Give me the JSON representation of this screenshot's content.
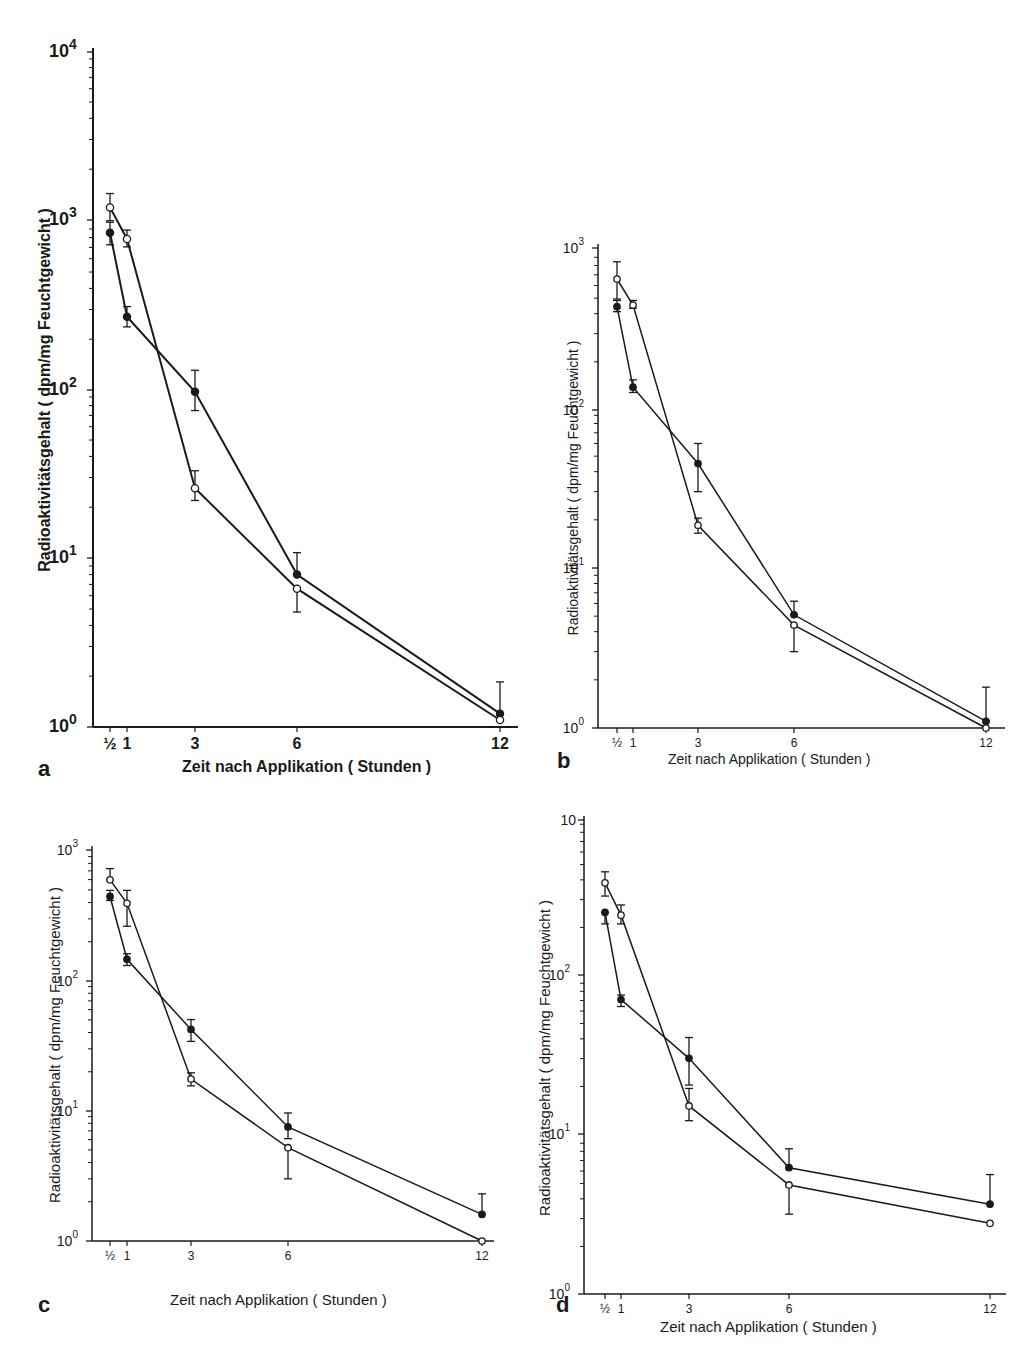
{
  "figure": {
    "x_axis_label": "Zeit nach Applikation ( Stunden )",
    "y_axis_label": "Radioaktivitätsgehalt  ( dpm/mg Feuchtgewicht )",
    "x_tick_labels": [
      "½",
      "1",
      "3",
      "6",
      "12"
    ],
    "legend_note": "filled circles (●) and open circles (○) series; mean ± error bars"
  },
  "chart_data": [
    {
      "panel": "a",
      "type": "line",
      "yscale": "log",
      "title": "",
      "xlabel": "Zeit nach Applikation ( Stunden )",
      "ylabel": "Radioaktivitätsgehalt ( dpm/mg Feuchtgewicht )",
      "x": [
        0.5,
        1,
        3,
        6,
        12
      ],
      "xticks": [
        "½",
        "1",
        "3",
        "6",
        "12"
      ],
      "yticks": [
        "10⁰",
        "10¹",
        "10²",
        "10³",
        "10⁴"
      ],
      "ylim": [
        1,
        10000
      ],
      "grid": false,
      "series": [
        {
          "name": "filled",
          "marker": "filled-circle",
          "values": [
            850,
            270,
            97,
            8.0,
            1.2
          ],
          "err_upper": [
            980,
            310,
            130,
            10.8,
            1.85
          ],
          "err_lower": [
            720,
            235,
            75,
            8.0,
            1.2
          ]
        },
        {
          "name": "open",
          "marker": "open-circle",
          "values": [
            1200,
            780,
            26,
            6.6,
            1.1
          ],
          "err_upper": [
            1450,
            880,
            33,
            6.6,
            1.1
          ],
          "err_lower": [
            1000,
            700,
            22,
            4.8,
            1.1
          ]
        }
      ]
    },
    {
      "panel": "b",
      "type": "line",
      "yscale": "log",
      "title": "",
      "xlabel": "Zeit nach Applikation ( Stunden )",
      "ylabel": "Radioaktivitätsgehalt ( dpm/mg Feuchtgewicht )",
      "x": [
        0.5,
        1,
        3,
        6,
        12
      ],
      "xticks": [
        "½",
        "1",
        "3",
        "6",
        "12"
      ],
      "yticks": [
        "10⁰",
        "10¹",
        "10²",
        "10³"
      ],
      "ylim": [
        1,
        1000
      ],
      "grid": false,
      "series": [
        {
          "name": "filled",
          "marker": "filled-circle",
          "values": [
            430,
            135,
            45,
            5.1,
            1.1
          ],
          "err_upper": [
            470,
            150,
            60,
            6.2,
            1.8
          ],
          "err_lower": [
            400,
            125,
            30,
            5.1,
            1.1
          ]
        },
        {
          "name": "open",
          "marker": "open-circle",
          "values": [
            640,
            440,
            18.5,
            4.4,
            1.0
          ],
          "err_upper": [
            820,
            470,
            20.5,
            4.4,
            1.0
          ],
          "err_lower": [
            480,
            420,
            16.5,
            3.0,
            1.0
          ]
        }
      ]
    },
    {
      "panel": "c",
      "type": "line",
      "yscale": "log",
      "title": "",
      "xlabel": "Zeit nach Applikation ( Stunden )",
      "ylabel": "Radioaktivitätsgehalt ( dpm/mg Feuchtgewicht )",
      "x": [
        0.5,
        1,
        3,
        6,
        12
      ],
      "xticks": [
        "½",
        "1",
        "3",
        "6",
        "12"
      ],
      "yticks": [
        "10⁰",
        "10¹",
        "10²",
        "10³"
      ],
      "ylim": [
        1,
        1000
      ],
      "grid": false,
      "series": [
        {
          "name": "filled",
          "marker": "filled-circle",
          "values": [
            440,
            145,
            42,
            7.5,
            1.6
          ],
          "err_upper": [
            490,
            160,
            50,
            9.6,
            2.3
          ],
          "err_lower": [
            410,
            130,
            34,
            6.1,
            1.6
          ]
        },
        {
          "name": "open",
          "marker": "open-circle",
          "values": [
            590,
            390,
            17.5,
            5.2,
            1.0
          ],
          "err_upper": [
            720,
            490,
            19.5,
            5.2,
            1.0
          ],
          "err_lower": [
            590,
            260,
            15.5,
            3.0,
            1.0
          ]
        }
      ]
    },
    {
      "panel": "d",
      "type": "line",
      "yscale": "log",
      "title": "",
      "xlabel": "Zeit nach Applikation ( Stunden )",
      "ylabel": "Radioaktivitätsgehalt ( dpm/mg Feuchtgewicht )",
      "x": [
        0.5,
        1,
        3,
        6,
        12
      ],
      "xticks": [
        "½",
        "1",
        "3",
        "6",
        "12"
      ],
      "yticks": [
        "10⁰",
        "10¹",
        "10²",
        "10"
      ],
      "ylim": [
        1,
        1000
      ],
      "grid": false,
      "series": [
        {
          "name": "filled",
          "marker": "filled-circle",
          "values": [
            260,
            73,
            31,
            6.3,
            3.7
          ],
          "err_upper": [
            260,
            78,
            42,
            8.3,
            5.7
          ],
          "err_lower": [
            220,
            66,
            21,
            6.3,
            3.7
          ]
        },
        {
          "name": "open",
          "marker": "open-circle",
          "values": [
            400,
            250,
            15.5,
            4.9,
            2.8
          ],
          "err_upper": [
            470,
            290,
            20,
            4.9,
            2.8
          ],
          "err_lower": [
            330,
            220,
            12.5,
            3.2,
            2.8
          ]
        }
      ]
    }
  ],
  "panels": [
    {
      "letter": "a",
      "ytop_label": "10",
      "ytop_exp": "4",
      "ylabels": [
        {
          "b": "10",
          "e": "0"
        },
        {
          "b": "10",
          "e": "1"
        },
        {
          "b": "10",
          "e": "2"
        },
        {
          "b": "10",
          "e": "3"
        },
        {
          "b": "10",
          "e": "4"
        }
      ]
    },
    {
      "letter": "b",
      "ylabels": [
        {
          "b": "10",
          "e": "0"
        },
        {
          "b": "10",
          "e": "1"
        },
        {
          "b": "10",
          "e": "2"
        },
        {
          "b": "10",
          "e": "3"
        }
      ]
    },
    {
      "letter": "c",
      "ylabels": [
        {
          "b": "10",
          "e": "0"
        },
        {
          "b": "10",
          "e": "1"
        },
        {
          "b": "10",
          "e": "2"
        },
        {
          "b": "10",
          "e": "3"
        }
      ]
    },
    {
      "letter": "d",
      "ylabels": [
        {
          "b": "10",
          "e": "0"
        },
        {
          "b": "10",
          "e": "1"
        },
        {
          "b": "10",
          "e": "2"
        },
        {
          "b": "10",
          "e": ""
        }
      ]
    }
  ]
}
